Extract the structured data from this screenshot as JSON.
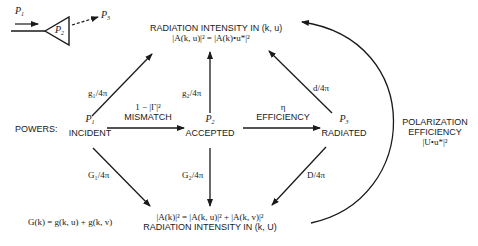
{
  "inset": {
    "p1": "P",
    "p1_sub": "1",
    "p2": "P",
    "p2_sub": "2",
    "p3": "P",
    "p3_sub": "3"
  },
  "nodes": {
    "powers_label": "POWERS:",
    "incident": {
      "symbol": "P",
      "sub": "1",
      "label": "INCIDENT"
    },
    "accepted": {
      "symbol": "P",
      "sub": "2",
      "label": "ACCEPTED"
    },
    "radiated": {
      "symbol": "P",
      "sub": "3",
      "label": "RADIATED"
    },
    "top": {
      "title": "RADIATION INTENSITY IN (k, u)",
      "formula": "|A(k, u)|² = |A(k)•u*|²"
    },
    "bottom": {
      "formula": "|A(k)|² = |A(k, u)|² + |A(k, v)|²",
      "title": "RADIATION INTENSITY IN (k, U)"
    }
  },
  "edges": {
    "mismatch": {
      "formula": "1 − |Γ|²",
      "label": "MISMATCH"
    },
    "efficiency": {
      "formula": "η",
      "label": "EFFICIENCY"
    },
    "g1": "g₁/4π",
    "g2": "g₂/4π",
    "d": "d/4π",
    "G1": "G₁/4π",
    "G2": "G₂/4π",
    "D": "D/4π"
  },
  "polarization": {
    "line1": "POLARIZATION",
    "line2": "EFFICIENCY",
    "formula": "|U•u*|²"
  },
  "gain_equation": "G(k) = g(k, u) + g(k, v)",
  "colors": {
    "ink": "#1a1a1a",
    "background": "#ffffff"
  }
}
